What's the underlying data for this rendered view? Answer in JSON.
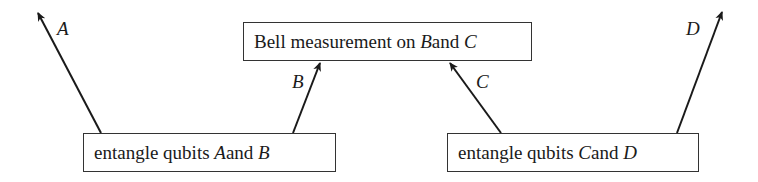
{
  "diagram": {
    "type": "flow",
    "boxes": {
      "bell": {
        "text_pre": "Bell measurement on ",
        "var1": "B",
        "text_mid": " and ",
        "var2": "C"
      },
      "entangle_ab": {
        "text_pre": "entangle qubits ",
        "var1": "A",
        "text_mid": " and ",
        "var2": "B"
      },
      "entangle_cd": {
        "text_pre": "entangle qubits ",
        "var1": "C",
        "text_mid": " and ",
        "var2": "D"
      }
    },
    "edges": [
      {
        "label": "A",
        "from": "entangle_ab",
        "to": "outside"
      },
      {
        "label": "B",
        "from": "entangle_ab",
        "to": "bell"
      },
      {
        "label": "C",
        "from": "entangle_cd",
        "to": "bell"
      },
      {
        "label": "D",
        "from": "entangle_cd",
        "to": "outside"
      }
    ],
    "labels": {
      "a": "A",
      "b": "B",
      "c": "C",
      "d": "D"
    }
  }
}
